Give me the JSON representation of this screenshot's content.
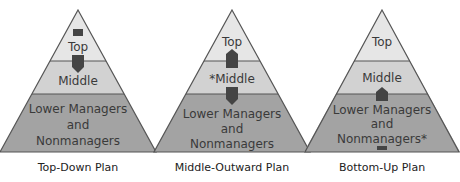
{
  "colors": {
    "top": "#e6e6e6",
    "middle": "#d2d2d2",
    "lower": "#a3a3a3",
    "outline": "#555555",
    "arrow": "#444444"
  },
  "pyramids": [
    {
      "caption": "Top-Down Plan",
      "top_label": "Top",
      "middle_label": "Middle",
      "lower_line1": "Lower Managers",
      "lower_line2": "and",
      "lower_line3": "Nonmanagers",
      "arrows": "down from top through middle"
    },
    {
      "caption": "Middle-Outward Plan",
      "top_label": "Top",
      "middle_label": "*Middle",
      "lower_line1": "Lower Managers",
      "lower_line2": "and",
      "lower_line3": "Nonmanagers",
      "arrows": "up to top and down to lower from middle"
    },
    {
      "caption": "Bottom-Up Plan",
      "top_label": "Top",
      "middle_label": "Middle",
      "lower_line1": "Lower Managers",
      "lower_line2": "and",
      "lower_line3": "Nonmanagers*",
      "arrows": "up from lower into middle"
    }
  ]
}
